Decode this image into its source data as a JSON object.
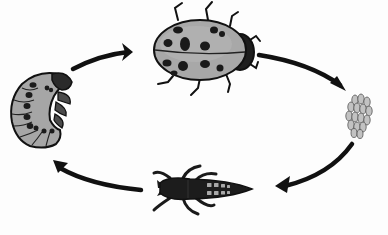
{
  "diagram": {
    "title": "Ladybug life cycle",
    "stages": [
      {
        "id": "adult",
        "icon": "ladybug-adult-icon",
        "label": "Adult"
      },
      {
        "id": "eggs",
        "icon": "egg-cluster-icon",
        "label": "Eggs"
      },
      {
        "id": "larva",
        "icon": "larva-icon",
        "label": "Larva"
      },
      {
        "id": "pupa",
        "icon": "pupa-icon",
        "label": "Pupa"
      }
    ],
    "arrows": [
      {
        "from": "pupa",
        "to": "adult",
        "icon": "arrow-icon"
      },
      {
        "from": "adult",
        "to": "eggs",
        "icon": "arrow-icon"
      },
      {
        "from": "eggs",
        "to": "larva",
        "icon": "arrow-icon"
      },
      {
        "from": "larva",
        "to": "pupa",
        "icon": "arrow-icon"
      }
    ],
    "colors": {
      "body_gray": "#a6a6a6",
      "light_gray": "#bdbdbd",
      "outline": "#1a1a1a",
      "spot": "#1c1c1c",
      "arrow": "#111111",
      "background": "#fdfdfd"
    }
  }
}
